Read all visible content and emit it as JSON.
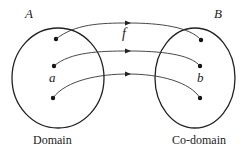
{
  "sets": {
    "A": {
      "name": "A",
      "caption": "Domain",
      "element_label": "a"
    },
    "B": {
      "name": "B",
      "caption": "Co-domain",
      "element_label": "b"
    }
  },
  "function_label": "f",
  "mappings": [
    {
      "from": "A.1",
      "to": "B.1"
    },
    {
      "from": "A.2 (a)",
      "to": "B.2 (b)"
    },
    {
      "from": "A.3",
      "to": "B.3"
    }
  ],
  "colors": {
    "stroke": "#222222",
    "background": "#ffffff"
  }
}
